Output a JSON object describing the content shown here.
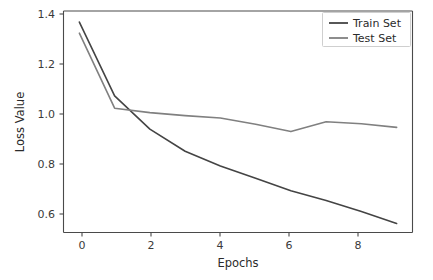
{
  "chart_data": {
    "type": "line",
    "title": "",
    "xlabel": "Epochs",
    "ylabel": "Loss Value",
    "xlim": [
      -0.45,
      9.45
    ],
    "ylim": [
      0.525,
      1.425
    ],
    "xticks": [
      0,
      2,
      4,
      6,
      8
    ],
    "xticklabels": [
      "0",
      "2",
      "4",
      "6",
      "8"
    ],
    "yticks": [
      0.6,
      0.8,
      1.0,
      1.2,
      1.4
    ],
    "yticklabels": [
      "0.6",
      "0.8",
      "1.0",
      "1.2",
      "1.4"
    ],
    "grid": false,
    "legend_position": "upper right",
    "x": [
      0,
      1,
      2,
      3,
      4,
      5,
      6,
      7,
      8,
      9
    ],
    "series": [
      {
        "name": "Train Set",
        "color": "#444444",
        "values": [
          1.38,
          1.08,
          0.945,
          0.855,
          0.795,
          0.745,
          0.695,
          0.655,
          0.61,
          0.562
        ]
      },
      {
        "name": "Test Set",
        "color": "#808080",
        "values": [
          1.335,
          1.03,
          1.012,
          1.0,
          0.99,
          0.965,
          0.935,
          0.975,
          0.967,
          0.952
        ]
      }
    ]
  },
  "legend": {
    "entries": [
      {
        "label": "Train Set"
      },
      {
        "label": "Test Set"
      }
    ]
  },
  "axes": {
    "xlabel": "Epochs",
    "ylabel": "Loss Value"
  }
}
